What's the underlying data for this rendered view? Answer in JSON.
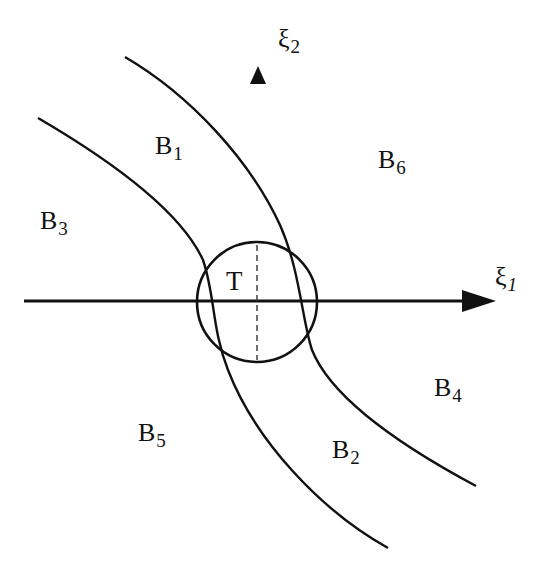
{
  "diagram": {
    "stroke_color": "#111111",
    "background_color": "#ffffff",
    "axes": {
      "xi1": {
        "symbol": "ξ",
        "subscript": "1"
      },
      "xi2": {
        "symbol": "ξ",
        "subscript": "2"
      }
    },
    "center_label": "T",
    "regions": [
      {
        "id": "B1",
        "letter": "B",
        "subscript": "1"
      },
      {
        "id": "B2",
        "letter": "B",
        "subscript": "2"
      },
      {
        "id": "B3",
        "letter": "B",
        "subscript": "3"
      },
      {
        "id": "B4",
        "letter": "B",
        "subscript": "4"
      },
      {
        "id": "B5",
        "letter": "B",
        "subscript": "5"
      },
      {
        "id": "B6",
        "letter": "B",
        "subscript": "6"
      }
    ]
  }
}
